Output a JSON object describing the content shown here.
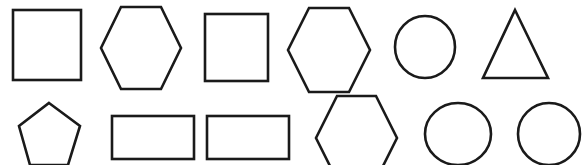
{
  "canvas": {
    "width": 584,
    "height": 165,
    "background_color": "#ffffff",
    "stroke_color": "#1a1a1a",
    "fill_color": "#ffffff",
    "stroke_width": 2.6
  },
  "figure": {
    "type": "geometric-shape-grid",
    "rows": 2,
    "columns": 6,
    "total_shapes": 12,
    "bottom_row_clipped": true
  },
  "shapes": [
    {
      "id": "shape-1",
      "name": "square",
      "row": 1,
      "column": 1,
      "geometry": "rect",
      "x": 13,
      "y": 10,
      "width": 68,
      "height": 70,
      "points": ""
    },
    {
      "id": "shape-2",
      "name": "hexagon",
      "row": 1,
      "column": 2,
      "geometry": "polygon",
      "x": 101,
      "y": 6,
      "width": 80,
      "height": 84,
      "points": "121,7 161,7 181,48 161,89 121,89 101,48"
    },
    {
      "id": "shape-3",
      "name": "square",
      "row": 1,
      "column": 3,
      "geometry": "rect",
      "x": 205,
      "y": 14,
      "width": 63,
      "height": 67,
      "points": ""
    },
    {
      "id": "shape-4",
      "name": "hexagon",
      "row": 1,
      "column": 4,
      "geometry": "polygon",
      "x": 288,
      "y": 7,
      "width": 82,
      "height": 85,
      "points": "309,8 349,8 370,50 349,92 309,92 288,50"
    },
    {
      "id": "shape-5",
      "name": "circle",
      "row": 1,
      "column": 5,
      "geometry": "ellipse",
      "cx": 425,
      "cy": 47,
      "rx": 30,
      "ry": 31,
      "points": ""
    },
    {
      "id": "shape-6",
      "name": "triangle",
      "row": 1,
      "column": 6,
      "geometry": "polygon",
      "x": 483,
      "y": 10,
      "width": 65,
      "height": 68,
      "points": "515,10 548,78 483,78"
    },
    {
      "id": "shape-7",
      "name": "pentagon",
      "row": 2,
      "column": 1,
      "geometry": "polygon",
      "x": 19,
      "y": 103,
      "width": 61,
      "height": 62,
      "points": "49,103 80,126 68,165 30,165 19,126"
    },
    {
      "id": "shape-8",
      "name": "rectangle",
      "row": 2,
      "column": 2,
      "geometry": "rect",
      "x": 112,
      "y": 116,
      "width": 82,
      "height": 43,
      "points": ""
    },
    {
      "id": "shape-9",
      "name": "rectangle",
      "row": 2,
      "column": 3,
      "geometry": "rect",
      "x": 207,
      "y": 116,
      "width": 82,
      "height": 43,
      "points": ""
    },
    {
      "id": "shape-10",
      "name": "hexagon",
      "row": 2,
      "column": 4,
      "geometry": "polygon",
      "x": 316,
      "y": 96,
      "width": 81,
      "height": 85,
      "points": "337,96 376,96 397,138 376,180 337,180 316,138"
    },
    {
      "id": "shape-11",
      "name": "circle",
      "row": 2,
      "column": 5,
      "geometry": "ellipse",
      "cx": 458,
      "cy": 134,
      "rx": 33,
      "ry": 31,
      "points": ""
    },
    {
      "id": "shape-12",
      "name": "circle",
      "row": 2,
      "column": 6,
      "geometry": "ellipse",
      "cx": 549,
      "cy": 134,
      "rx": 31,
      "ry": 31,
      "points": ""
    }
  ]
}
